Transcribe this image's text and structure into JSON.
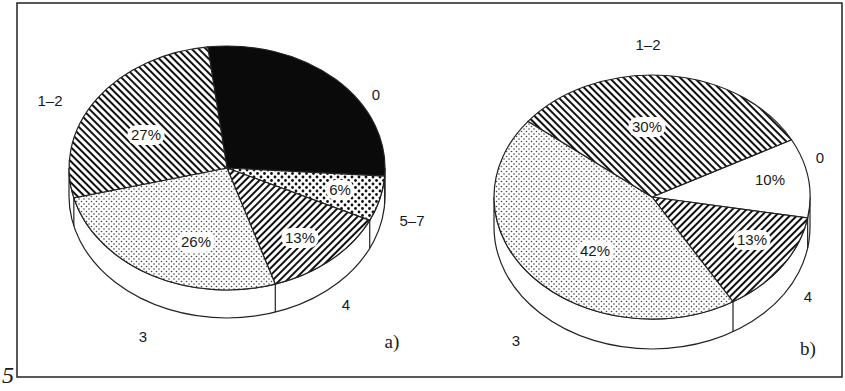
{
  "figure": {
    "number": "5",
    "frame": {
      "x": 17,
      "y": 3,
      "width": 825,
      "height": 374
    }
  },
  "chart_data": [
    {
      "type": "pie",
      "panel": "a)",
      "title": "",
      "geometry": {
        "cx": 227,
        "cy": 168,
        "rx": 158,
        "ry": 122,
        "depth": 28,
        "start_angle_deg": -97
      },
      "slices": [
        {
          "category": "0",
          "value": 28,
          "pct_label": "",
          "fill": "black",
          "label_pos": [
            376,
            100
          ],
          "pct_pos": [
            0,
            0
          ]
        },
        {
          "category": "5–7",
          "value": 6,
          "pct_label": "6%",
          "fill": "dots-coarse",
          "label_pos": [
            412,
            226
          ],
          "pct_pos": [
            340,
            194
          ]
        },
        {
          "category": "4",
          "value": 13,
          "pct_label": "13%",
          "fill": "hatch-back",
          "label_pos": [
            346,
            310
          ],
          "pct_pos": [
            300,
            242
          ]
        },
        {
          "category": "3",
          "value": 26,
          "pct_label": "26%",
          "fill": "dots-fine",
          "label_pos": [
            143,
            342
          ],
          "pct_pos": [
            196,
            246
          ]
        },
        {
          "category": "1–2",
          "value": 27,
          "pct_label": "27%",
          "fill": "hatch-fwd",
          "label_pos": [
            50,
            106
          ],
          "pct_pos": [
            146,
            139
          ]
        }
      ],
      "panel_label_pos": [
        392,
        348
      ]
    },
    {
      "type": "pie",
      "panel": "b)",
      "title": "",
      "geometry": {
        "cx": 652,
        "cy": 197,
        "rx": 158,
        "ry": 122,
        "depth": 30,
        "start_angle_deg": -28
      },
      "slices": [
        {
          "category": "0",
          "value": 10,
          "pct_label": "10%",
          "fill": "white",
          "label_pos": [
            820,
            163
          ],
          "pct_pos": [
            770,
            184
          ]
        },
        {
          "category": "4",
          "value": 13,
          "pct_label": "13%",
          "fill": "hatch-back",
          "label_pos": [
            808,
            302
          ],
          "pct_pos": [
            752,
            244
          ]
        },
        {
          "category": "3",
          "value": 42,
          "pct_label": "42%",
          "fill": "dots-fine",
          "label_pos": [
            516,
            346
          ],
          "pct_pos": [
            595,
            255
          ]
        },
        {
          "category": "1–2",
          "value": 30,
          "pct_label": "30%",
          "fill": "hatch-fwd",
          "label_pos": [
            648,
            50
          ],
          "pct_pos": [
            647,
            131
          ]
        }
      ],
      "panel_label_pos": [
        808,
        355
      ]
    }
  ]
}
